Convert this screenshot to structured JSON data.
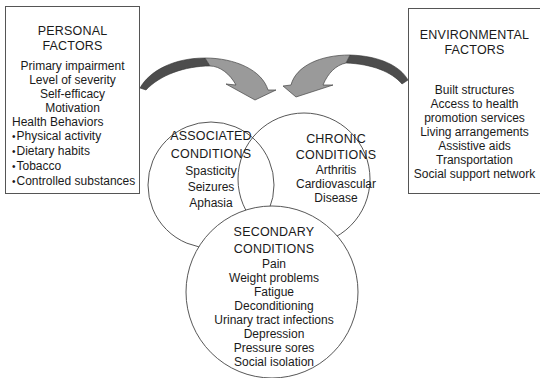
{
  "personal_factors": {
    "title_line1": "PERSONAL",
    "title_line2": "FACTORS",
    "items": [
      "Primary impairment",
      "Level of severity",
      "Self-efficacy",
      "Motivation"
    ],
    "health_behaviors_label": "Health Behaviors",
    "health_behaviors": [
      "Physical activity",
      "Dietary habits",
      "Tobacco",
      "Controlled substances"
    ]
  },
  "environmental_factors": {
    "title_line1": "ENVIRONMENTAL",
    "title_line2": "FACTORS",
    "items": [
      "Built structures",
      "Access to health",
      "promotion services",
      "Living arrangements",
      "Assistive aids",
      "Transportation",
      "Social support network"
    ]
  },
  "associated_conditions": {
    "title_line1": "ASSOCIATED",
    "title_line2": "CONDITIONS",
    "items": [
      "Spasticity",
      "Seizures",
      "Aphasia"
    ]
  },
  "chronic_conditions": {
    "title_line1": "CHRONIC",
    "title_line2": "CONDITIONS",
    "items": [
      "Arthritis",
      "Cardiovascular",
      "Disease"
    ]
  },
  "secondary_conditions": {
    "title_line1": "SECONDARY",
    "title_line2": "CONDITIONS",
    "items": [
      "Pain",
      "Weight problems",
      "Fatigue",
      "Deconditioning",
      "Urinary tract infections",
      "Depression",
      "Pressure sores",
      "Social isolation"
    ]
  },
  "colors": {
    "arrow_dark": "#555555",
    "arrow_light": "#9a9a9a",
    "outline": "#444444"
  }
}
